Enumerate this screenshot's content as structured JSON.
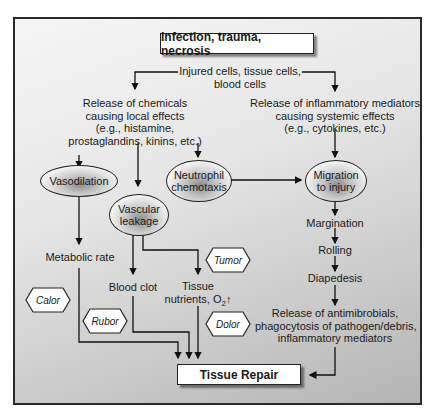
{
  "diagram": {
    "top_box": "Infection, trauma, necrosis",
    "source": {
      "line1": "Injured cells, tissue cells,",
      "line2": "blood cells"
    },
    "local_branch": {
      "lines": [
        "Release of chemicals",
        "causing local effects",
        "(e.g., histamine,",
        "prostaglandins, kinins, etc.)"
      ]
    },
    "systemic_branch": {
      "lines": [
        "Release of inflammatory mediators",
        "causing systemic effects",
        "(e.g., cytokines, etc.)"
      ]
    },
    "ellipses": {
      "vasodilation": "Vasodilation",
      "vascular_leakage": {
        "line1": "Vascular",
        "line2": "leakage"
      },
      "neutrophil_chemotaxis": {
        "line1": "Neutrophil",
        "line2": "chemotaxis"
      },
      "migration": {
        "line1": "Migration",
        "line2": "to injury"
      }
    },
    "steps": {
      "metabolic_rate": "Metabolic rate",
      "blood_clot": "Blood clot",
      "tissue_nutrients": {
        "line1": "Tissue",
        "line2": "nutrients, O",
        "sub": "2",
        "arrow": "↑"
      },
      "margination": "Margination",
      "rolling": "Rolling",
      "diapedesis": "Diapedesis",
      "release": [
        "Release of antimibrobials,",
        "phagocytosis of pathogen/debris,",
        "inflammatory mediators"
      ]
    },
    "signs": {
      "calor": "Calor",
      "rubor": "Rubor",
      "tumor": "Tumor",
      "dolor": "Dolor"
    },
    "bottom_box": "Tissue Repair"
  }
}
